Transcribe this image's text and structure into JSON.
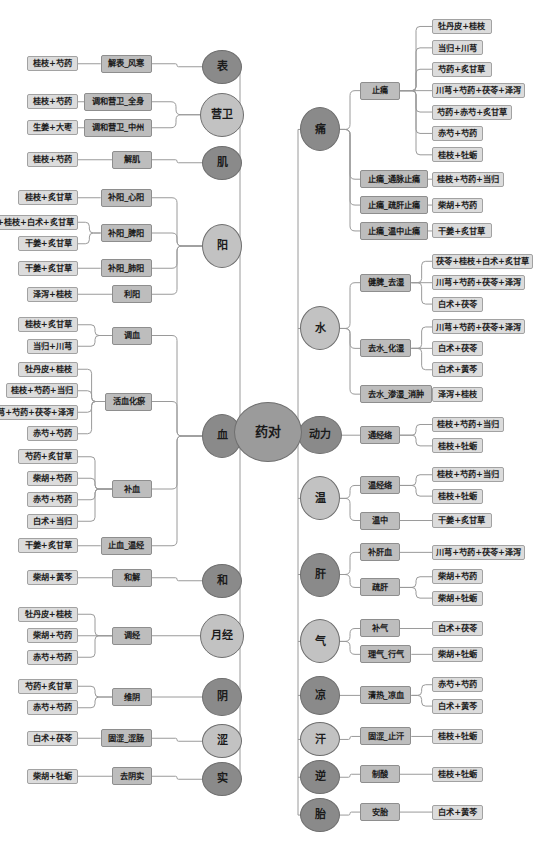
{
  "diagram": {
    "type": "mindmap",
    "root": {
      "label": "药对"
    },
    "left_branches": [
      {
        "label": "表",
        "tone": "dark",
        "functions": [
          {
            "label": "解表_风寒",
            "tone": "mid",
            "leaves": [
              "桂枝+芍药"
            ]
          }
        ]
      },
      {
        "label": "营卫",
        "tone": "light",
        "functions": [
          {
            "label": "调和营卫_全身",
            "tone": "mid",
            "leaves": [
              "桂枝+芍药"
            ]
          },
          {
            "label": "调和营卫_中州",
            "tone": "mid",
            "leaves": [
              "生姜+大枣"
            ]
          }
        ]
      },
      {
        "label": "肌",
        "tone": "dark",
        "functions": [
          {
            "label": "解肌",
            "tone": "mid",
            "leaves": [
              "桂枝+芍药"
            ]
          }
        ]
      },
      {
        "label": "阳",
        "tone": "light",
        "functions": [
          {
            "label": "补阳_心阳",
            "tone": "mid",
            "leaves": [
              "桂枝+炙甘草"
            ]
          },
          {
            "label": "补阳_脾阳",
            "tone": "mid",
            "leaves": [
              "茯苓+桂枝+白术+炙甘草",
              "干姜+炙甘草"
            ]
          },
          {
            "label": "补阳_肺阳",
            "tone": "mid",
            "leaves": [
              "干姜+炙甘草"
            ]
          },
          {
            "label": "利阳",
            "tone": "mid",
            "leaves": [
              "泽泻+桂枝"
            ]
          }
        ]
      },
      {
        "label": "血",
        "tone": "dark",
        "functions": [
          {
            "label": "调血",
            "tone": "mid",
            "leaves": [
              "桂枝+炙甘草",
              "当归+川芎"
            ]
          },
          {
            "label": "活血化瘀",
            "tone": "mid",
            "leaves": [
              "牡丹皮+桂枝",
              "桂枝+芍药+当归",
              "川芎+芍药+茯苓+泽泻",
              "赤芍+芍药"
            ]
          },
          {
            "label": "补血",
            "tone": "mid",
            "leaves": [
              "芍药+炙甘草",
              "柴胡+芍药",
              "赤芍+芍药",
              "白术+当归"
            ]
          },
          {
            "label": "止血_温经",
            "tone": "mid",
            "leaves": [
              "干姜+炙甘草"
            ]
          }
        ]
      },
      {
        "label": "和",
        "tone": "dark",
        "functions": [
          {
            "label": "和解",
            "tone": "mid",
            "leaves": [
              "柴胡+黄芩"
            ]
          }
        ]
      },
      {
        "label": "月经",
        "tone": "light",
        "functions": [
          {
            "label": "调经",
            "tone": "mid",
            "leaves": [
              "牡丹皮+桂枝",
              "柴胡+芍药",
              "赤芍+芍药"
            ]
          }
        ]
      },
      {
        "label": "阴",
        "tone": "dark",
        "functions": [
          {
            "label": "维阴",
            "tone": "mid",
            "leaves": [
              "芍药+炙甘草",
              "赤芍+芍药"
            ]
          }
        ]
      },
      {
        "label": "涩",
        "tone": "light",
        "functions": [
          {
            "label": "固涩_涩肠",
            "tone": "mid",
            "leaves": [
              "白术+茯苓"
            ]
          }
        ]
      },
      {
        "label": "实",
        "tone": "dark",
        "functions": [
          {
            "label": "去阴实",
            "tone": "mid",
            "leaves": [
              "柴胡+牡蛎"
            ]
          }
        ]
      }
    ],
    "right_branches": [
      {
        "label": "痛",
        "tone": "dark",
        "functions": [
          {
            "label": "止痛",
            "tone": "mid",
            "leaves": [
              "牡丹皮+桂枝",
              "当归+川芎",
              "芍药+炙甘草",
              "川芎+芍药+茯苓+泽泻",
              "芍药+赤芍+炙甘草",
              "赤芍+芍药",
              "桂枝+牡蛎"
            ]
          },
          {
            "label": "止痛_通脉止痛",
            "tone": "mid",
            "leaves": [
              "桂枝+芍药+当归"
            ]
          },
          {
            "label": "止痛_疏肝止痛",
            "tone": "mid",
            "leaves": [
              "柴胡+芍药"
            ]
          },
          {
            "label": "止痛_温中止痛",
            "tone": "mid",
            "leaves": [
              "干姜+炙甘草"
            ]
          }
        ]
      },
      {
        "label": "水",
        "tone": "light",
        "functions": [
          {
            "label": "健脾_去湿",
            "tone": "mid",
            "leaves": [
              "茯苓+桂枝+白术+炙甘草",
              "川芎+芍药+茯苓+泽泻",
              "白术+茯苓"
            ]
          },
          {
            "label": "去水_化湿",
            "tone": "mid",
            "leaves": [
              "川芎+芍药+茯苓+泽泻",
              "白术+茯苓",
              "白术+黄芩"
            ]
          },
          {
            "label": "去水_渗湿_消肿",
            "tone": "mid",
            "leaves": [
              "泽泻+桂枝"
            ]
          }
        ]
      },
      {
        "label": "动力",
        "tone": "dark",
        "functions": [
          {
            "label": "通经络",
            "tone": "mid",
            "leaves": [
              "桂枝+芍药+当归",
              "桂枝+牡蛎"
            ]
          }
        ]
      },
      {
        "label": "温",
        "tone": "light",
        "functions": [
          {
            "label": "温经络",
            "tone": "mid",
            "leaves": [
              "桂枝+芍药+当归",
              "桂枝+牡蛎"
            ]
          },
          {
            "label": "温中",
            "tone": "mid",
            "leaves": [
              "干姜+炙甘草"
            ]
          }
        ]
      },
      {
        "label": "肝",
        "tone": "dark",
        "functions": [
          {
            "label": "补肝血",
            "tone": "mid",
            "leaves": [
              "川芎+芍药+茯苓+泽泻"
            ]
          },
          {
            "label": "疏肝",
            "tone": "mid",
            "leaves": [
              "柴胡+芍药",
              "柴胡+牡蛎"
            ]
          }
        ]
      },
      {
        "label": "气",
        "tone": "light",
        "functions": [
          {
            "label": "补气",
            "tone": "mid",
            "leaves": [
              "白术+茯苓"
            ]
          },
          {
            "label": "理气_行气",
            "tone": "mid",
            "leaves": [
              "柴胡+牡蛎"
            ]
          }
        ]
      },
      {
        "label": "凉",
        "tone": "dark",
        "functions": [
          {
            "label": "清热_凉血",
            "tone": "mid",
            "leaves": [
              "赤芍+芍药",
              "白术+黄芩"
            ]
          }
        ]
      },
      {
        "label": "汗",
        "tone": "light",
        "functions": [
          {
            "label": "固涩_止汗",
            "tone": "mid",
            "leaves": [
              "桂枝+牡蛎"
            ]
          }
        ]
      },
      {
        "label": "逆",
        "tone": "dark",
        "functions": [
          {
            "label": "制酸",
            "tone": "mid",
            "leaves": [
              "桂枝+牡蛎"
            ]
          }
        ]
      },
      {
        "label": "胎",
        "tone": "dark",
        "functions": [
          {
            "label": "安胎",
            "tone": "mid",
            "leaves": [
              "白术+黄芩"
            ]
          }
        ]
      }
    ],
    "colors": {
      "node_dark": "#8a8a8a",
      "node_light": "#c2c2c2",
      "function_box": "#bdbdbd",
      "leaf_box": "#dcdcdc",
      "line": "#9a9a9a",
      "text": "#1b1b1b",
      "background": "#ffffff"
    }
  }
}
